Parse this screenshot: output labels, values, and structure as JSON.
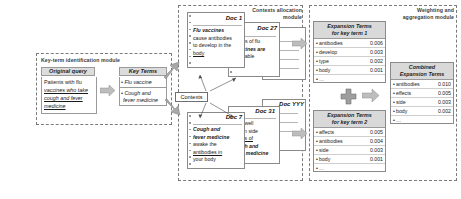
{
  "modules": {
    "key_term": {
      "title": "Key-term identification module"
    },
    "contexts_allocation": {
      "title_line1": "Contexts allocation",
      "title_line2": "module"
    },
    "weighting": {
      "title_line1": "Weighting and",
      "title_line2": "aggregation  module"
    }
  },
  "query": {
    "header": "Original query",
    "line1": "Patients with flu",
    "line2": "vaccines who take",
    "line3": "cough and fever",
    "line4": "medicine"
  },
  "key_terms": {
    "header": "Key Terms",
    "items": [
      {
        "bullet": "•",
        "line1": "Flu vaccine",
        "line2": ""
      },
      {
        "bullet": "•",
        "line1": "Cough and",
        "line2": "fever medicine"
      }
    ]
  },
  "contexts_label": "Contexts",
  "documents": [
    {
      "title": "Doc 1",
      "line1": "Flu vaccines",
      "line2": "cause antibodies",
      "line3": "to develop in the",
      "line4": "body"
    },
    {
      "title": "Doc 27",
      "line1": "…pes of flu",
      "line2": "vaccines are",
      "line3": "available",
      "line4": ""
    },
    {
      "title": "XXX",
      "line1": "",
      "line2": "",
      "line3": "",
      "line4": ""
    },
    {
      "title": "Doc 7",
      "line1": "Cough and",
      "line2": "fever medicine",
      "line3": "awake the",
      "line4": "antibodies in",
      "line5": "your body"
    },
    {
      "title": "Doc 31",
      "line1": "…nd well",
      "line2": "known side",
      "line3": "effects of",
      "line4": "cough and",
      "line5": "fever medicine"
    },
    {
      "title": "Doc YYY",
      "line1": "",
      "line2": "",
      "line3": "",
      "line4": ""
    }
  ],
  "expansion_tables": [
    {
      "header_line1": "Expansion Terms",
      "header_line2": "for key term 1",
      "rows": [
        {
          "bullet": "•",
          "term": "antibodies",
          "value": "0.006"
        },
        {
          "bullet": "•",
          "term": "develop",
          "value": "0.003"
        },
        {
          "bullet": "•",
          "term": "type",
          "value": "0.002"
        },
        {
          "bullet": "•",
          "term": "body",
          "value": "0.001"
        },
        {
          "bullet": "•",
          "term": "…",
          "value": ""
        }
      ]
    },
    {
      "header_line1": "Expansion Terms",
      "header_line2": "for key term 2",
      "rows": [
        {
          "bullet": "•",
          "term": "affects",
          "value": "0.005"
        },
        {
          "bullet": "•",
          "term": "antibodies",
          "value": "0.004"
        },
        {
          "bullet": "•",
          "term": "side",
          "value": "0.003"
        },
        {
          "bullet": "•",
          "term": "body",
          "value": "0.001"
        },
        {
          "bullet": "•",
          "term": "…",
          "value": ""
        }
      ]
    }
  ],
  "combined_table": {
    "header_line1": "Combined",
    "header_line2": "Expansion Terms",
    "rows": [
      {
        "bullet": "•",
        "term": "antibodies",
        "value": "0.010"
      },
      {
        "bullet": "•",
        "term": "effects",
        "value": "0.005"
      },
      {
        "bullet": "•",
        "term": "side",
        "value": "0.003"
      },
      {
        "bullet": "•",
        "term": "body",
        "value": "0.002"
      },
      {
        "bullet": "•",
        "term": "…",
        "value": ""
      }
    ]
  },
  "symbols": {
    "plus": "+"
  },
  "colors": {
    "header_fill": "#d9d9d9",
    "arrow_fill": "#b3b3b3",
    "frame_stroke": "#7a7a7a",
    "box_stroke": "#8a8a8a"
  }
}
